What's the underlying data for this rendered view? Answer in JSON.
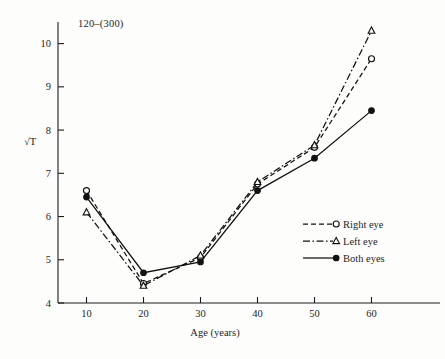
{
  "figure": {
    "title": "120–(300)",
    "background_color": "#fdfdfc",
    "ink_color": "#111111"
  },
  "axes": {
    "y_label": "√T",
    "x_label": "Age (years)",
    "x_ticks": [
      "10",
      "20",
      "30",
      "40",
      "50",
      "60"
    ],
    "y_ticks": [
      "4",
      "5",
      "6",
      "7",
      "8",
      "9",
      "10"
    ]
  },
  "legend": {
    "entries": [
      {
        "label": "Right eye",
        "marker": "open-circle",
        "line_style": "dashed"
      },
      {
        "label": "Left eye",
        "marker": "open-triangle",
        "line_style": "dash-dot"
      },
      {
        "label": "Both eyes",
        "marker": "filled-circle",
        "line_style": "solid"
      }
    ]
  },
  "chart_data": {
    "type": "line",
    "title": "120–(300)",
    "xlabel": "Age (years)",
    "ylabel": "√T",
    "x": [
      10,
      20,
      30,
      40,
      50,
      60
    ],
    "xlim": [
      5,
      65
    ],
    "ylim": [
      4,
      10.5
    ],
    "grid": false,
    "legend_position": "right-center",
    "series": [
      {
        "name": "Right eye",
        "marker": "open-circle",
        "line_style": "dashed",
        "values": [
          6.6,
          4.45,
          5.05,
          6.75,
          7.6,
          9.65
        ]
      },
      {
        "name": "Left eye",
        "marker": "open-triangle",
        "line_style": "dash-dot",
        "values": [
          6.1,
          4.4,
          5.1,
          6.8,
          7.65,
          10.3
        ]
      },
      {
        "name": "Both eyes",
        "marker": "filled-circle",
        "line_style": "solid",
        "values": [
          6.45,
          4.7,
          4.95,
          6.6,
          7.35,
          8.45
        ]
      }
    ]
  }
}
